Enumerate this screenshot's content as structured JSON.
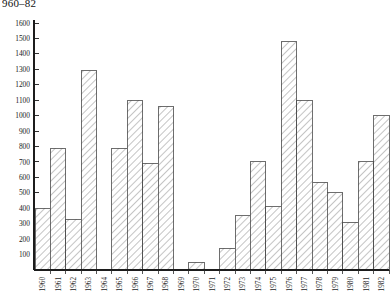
{
  "caption": {
    "text": "960–82"
  },
  "chart_data": {
    "type": "bar",
    "title": "960–82",
    "xlabel": "",
    "ylabel": "",
    "categories": [
      "1960",
      "1961",
      "1962",
      "1963",
      "1964",
      "1965",
      "1966",
      "1967",
      "1968",
      "1969",
      "1970",
      "1971",
      "1972",
      "1973",
      "1974",
      "1975",
      "1976",
      "1977",
      "1978",
      "1979",
      "1980",
      "1981",
      "1982"
    ],
    "values": [
      400,
      790,
      330,
      1290,
      0,
      790,
      1100,
      690,
      1060,
      0,
      50,
      0,
      140,
      350,
      700,
      410,
      1480,
      1100,
      570,
      500,
      310,
      700,
      1000
    ],
    "ylim": [
      0,
      1600
    ],
    "yticks": [
      100,
      200,
      300,
      400,
      500,
      600,
      700,
      800,
      900,
      1000,
      1100,
      1200,
      1300,
      1400,
      1500,
      1600
    ],
    "ytick_labels": [
      "100",
      "200",
      "300",
      "400",
      "500",
      "600",
      "700",
      "800",
      "900",
      "1000",
      "1100",
      "1200",
      "1300",
      "1400",
      "1500",
      "1600"
    ],
    "grid": false,
    "legend": null,
    "bar_style": "hatched-diagonal"
  }
}
